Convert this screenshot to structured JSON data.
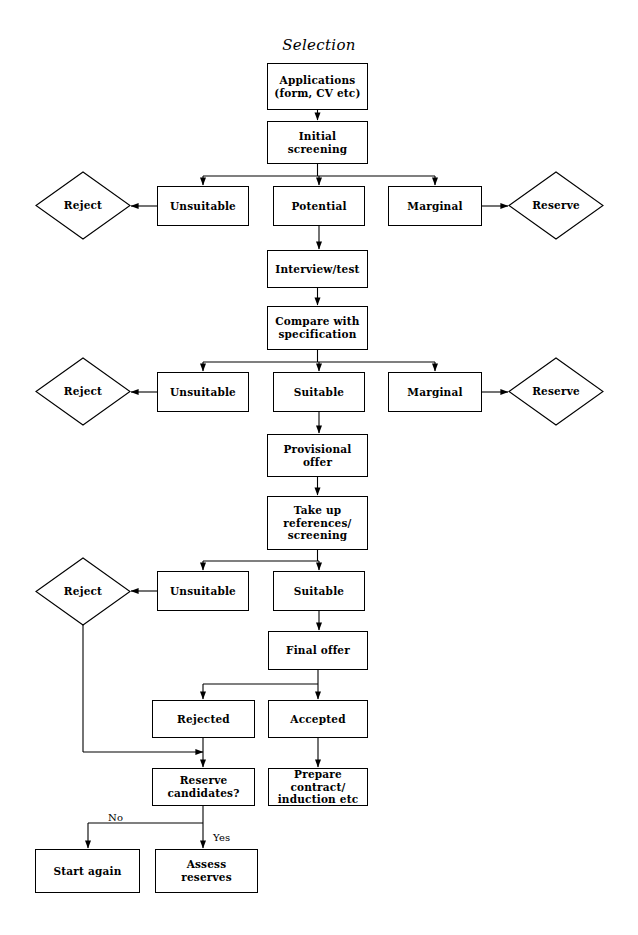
{
  "title": "Selection",
  "diagram": {
    "type": "flowchart",
    "nodes": [
      {
        "id": "applications",
        "label": "Applications\n(form, CV etc)",
        "shape": "box",
        "x": 267,
        "y": 63,
        "w": 101,
        "h": 47
      },
      {
        "id": "initial_screening",
        "label": "Initial\nscreening",
        "shape": "box",
        "x": 267,
        "y": 121,
        "w": 101,
        "h": 43
      },
      {
        "id": "reject_1",
        "label": "Reject",
        "shape": "diamond",
        "x": 36,
        "y": 172,
        "w": 94,
        "h": 67
      },
      {
        "id": "unsuitable_1",
        "label": "Unsuitable",
        "shape": "box",
        "x": 157,
        "y": 186,
        "w": 92,
        "h": 40
      },
      {
        "id": "potential",
        "label": "Potential",
        "shape": "box",
        "x": 273,
        "y": 186,
        "w": 92,
        "h": 40
      },
      {
        "id": "marginal_1",
        "label": "Marginal",
        "shape": "box",
        "x": 388,
        "y": 186,
        "w": 94,
        "h": 40
      },
      {
        "id": "reserve_1",
        "label": "Reserve",
        "shape": "diamond",
        "x": 509,
        "y": 172,
        "w": 94,
        "h": 67
      },
      {
        "id": "interview_test",
        "label": "Interview/test",
        "shape": "box",
        "x": 267,
        "y": 250,
        "w": 101,
        "h": 38
      },
      {
        "id": "compare_spec",
        "label": "Compare with\nspecification",
        "shape": "box",
        "x": 267,
        "y": 306,
        "w": 101,
        "h": 44
      },
      {
        "id": "reject_2",
        "label": "Reject",
        "shape": "diamond",
        "x": 36,
        "y": 358,
        "w": 94,
        "h": 67
      },
      {
        "id": "unsuitable_2",
        "label": "Unsuitable",
        "shape": "box",
        "x": 157,
        "y": 372,
        "w": 92,
        "h": 40
      },
      {
        "id": "suitable_1",
        "label": "Suitable",
        "shape": "box",
        "x": 273,
        "y": 372,
        "w": 92,
        "h": 40
      },
      {
        "id": "marginal_2",
        "label": "Marginal",
        "shape": "box",
        "x": 388,
        "y": 372,
        "w": 94,
        "h": 40
      },
      {
        "id": "reserve_2",
        "label": "Reserve",
        "shape": "diamond",
        "x": 509,
        "y": 358,
        "w": 94,
        "h": 67
      },
      {
        "id": "provisional_offer",
        "label": "Provisional\noffer",
        "shape": "box",
        "x": 267,
        "y": 434,
        "w": 101,
        "h": 43
      },
      {
        "id": "take_up_references",
        "label": "Take up\nreferences/\nscreening",
        "shape": "box",
        "x": 267,
        "y": 496,
        "w": 101,
        "h": 54
      },
      {
        "id": "reject_3",
        "label": "Reject",
        "shape": "diamond",
        "x": 36,
        "y": 558,
        "w": 94,
        "h": 67
      },
      {
        "id": "unsuitable_3",
        "label": "Unsuitable",
        "shape": "box",
        "x": 157,
        "y": 571,
        "w": 92,
        "h": 40
      },
      {
        "id": "suitable_2",
        "label": "Suitable",
        "shape": "box",
        "x": 273,
        "y": 571,
        "w": 92,
        "h": 40
      },
      {
        "id": "final_offer",
        "label": "Final offer",
        "shape": "box",
        "x": 268,
        "y": 631,
        "w": 100,
        "h": 39
      },
      {
        "id": "rejected",
        "label": "Rejected",
        "shape": "box",
        "x": 152,
        "y": 700,
        "w": 103,
        "h": 38
      },
      {
        "id": "accepted",
        "label": "Accepted",
        "shape": "box",
        "x": 268,
        "y": 700,
        "w": 100,
        "h": 38
      },
      {
        "id": "reserve_candidates",
        "label": "Reserve\ncandidates?",
        "shape": "box",
        "x": 152,
        "y": 768,
        "w": 103,
        "h": 38
      },
      {
        "id": "prepare_contract",
        "label": "Prepare contract/\ninduction etc",
        "shape": "box",
        "x": 268,
        "y": 768,
        "w": 100,
        "h": 38
      },
      {
        "id": "start_again",
        "label": "Start again",
        "shape": "box",
        "x": 35,
        "y": 849,
        "w": 105,
        "h": 44
      },
      {
        "id": "assess_reserves",
        "label": "Assess\nreserves",
        "shape": "box",
        "x": 155,
        "y": 849,
        "w": 103,
        "h": 44
      }
    ],
    "edge_labels": [
      {
        "id": "no_label",
        "text": "No",
        "x": 108,
        "y": 812
      },
      {
        "id": "yes_label",
        "text": "Yes",
        "x": 213,
        "y": 832
      }
    ],
    "colors": {
      "stroke": "#000000",
      "fill": "#ffffff",
      "text": "#000000"
    }
  }
}
